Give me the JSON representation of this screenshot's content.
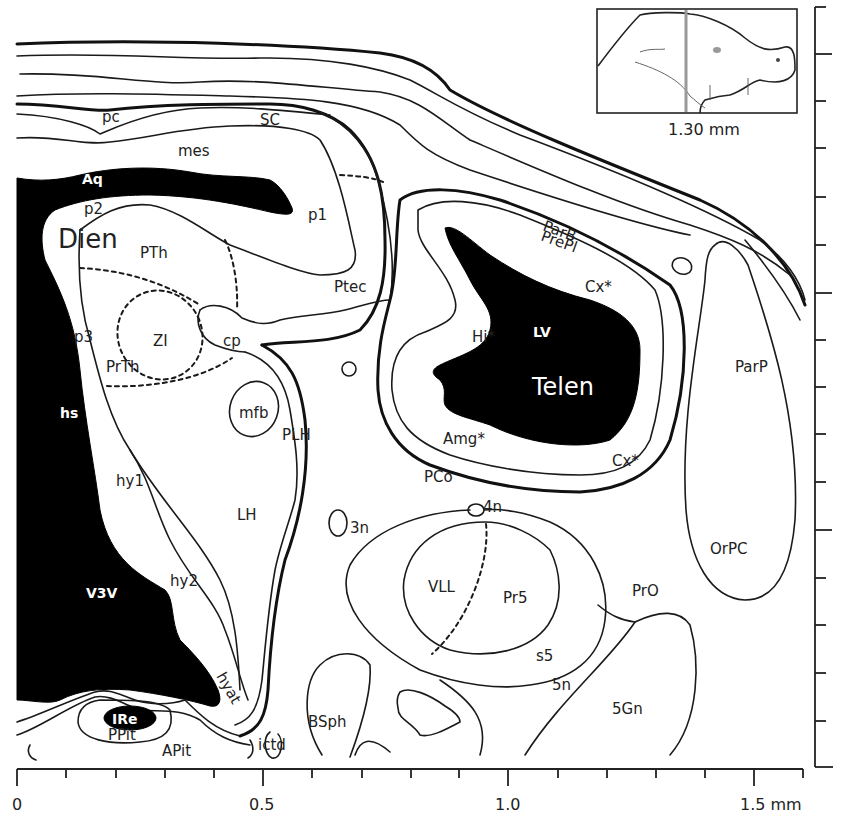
{
  "inset": {
    "caption": "1.30 mm",
    "marker_color": "#999999"
  },
  "labels": {
    "pc": "pc",
    "SC": "SC",
    "mes": "mes",
    "Aq": "Aq",
    "p2": "p2",
    "Dien": "Dien",
    "PTh": "PTh",
    "p1": "p1",
    "Ptec": "Ptec",
    "p3": "p3",
    "ZI": "ZI",
    "PrTh": "PrTh",
    "cp": "cp",
    "hs": "hs",
    "mfb": "mfb",
    "PLH": "PLH",
    "hy1": "hy1",
    "LH": "LH",
    "hy2": "hy2",
    "V3V": "V3V",
    "hyat": "hyat",
    "IRe": "IRe",
    "PPit": "PPit",
    "APit": "APit",
    "ictd": "ictd",
    "BSph": "BSph",
    "3n": "3n",
    "4n": "4n",
    "VLL": "VLL",
    "Pr5": "Pr5",
    "s5": "s5",
    "5n": "5n",
    "PrO": "PrO",
    "5Gn": "5Gn",
    "ParB": "ParB",
    "PrePl": "PrePl",
    "Cx_top": "Cx*",
    "Hi": "Hi*",
    "LV": "LV",
    "Telen": "Telen",
    "Amg": "Amg*",
    "Cx_bottom": "Cx*",
    "PCo": "PCo",
    "ParP": "ParP",
    "OrPC": "OrPC"
  },
  "scale_x": {
    "tick_labels": [
      "0",
      "0.5",
      "1.0",
      "1.5 mm"
    ],
    "major_ticks_mm": [
      0,
      0.5,
      1.0,
      1.5
    ],
    "minor_step_mm": 0.1,
    "range_mm": [
      0,
      1.6
    ]
  },
  "scale_y": {
    "minor_step_mm": 0.1,
    "major_every": 5
  }
}
